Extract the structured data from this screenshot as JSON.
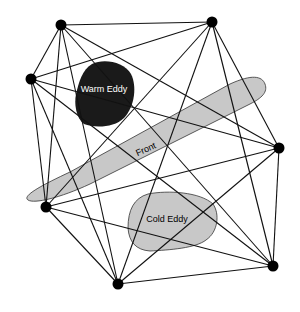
{
  "diagram": {
    "type": "network",
    "nodes": [
      {
        "id": "n1"
      },
      {
        "id": "n2"
      },
      {
        "id": "n3"
      },
      {
        "id": "n4"
      },
      {
        "id": "n5"
      },
      {
        "id": "n6"
      },
      {
        "id": "n7"
      }
    ],
    "connectivity": "complete",
    "features": {
      "warm_eddy": {
        "label": "Warm Eddy",
        "fill": "#1a1a1a",
        "text_color": "#ffffff"
      },
      "front": {
        "label": "Front",
        "fill": "#c8c8c8",
        "text_color": "#111111"
      },
      "cold_eddy": {
        "label": "Cold Eddy",
        "fill": "#c8c8c8",
        "text_color": "#111111"
      }
    },
    "edge_color": "#111111",
    "node_color": "#000000"
  }
}
